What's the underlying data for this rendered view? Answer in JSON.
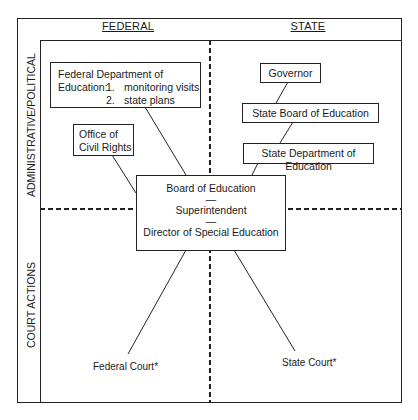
{
  "diagram": {
    "columns": [
      {
        "id": "federal",
        "label": "FEDERAL"
      },
      {
        "id": "state",
        "label": "STATE"
      }
    ],
    "rows": [
      {
        "id": "admin",
        "label": "ADMINISTRATIVE/POLITICAL"
      },
      {
        "id": "court",
        "label": "COURT ACTIONS"
      }
    ],
    "nodes": {
      "fed_dept": {
        "line1": "Federal Department of",
        "line2_prefix": "Education:",
        "items": [
          {
            "num": "1.",
            "text": "monitoring visits"
          },
          {
            "num": "2.",
            "text": "state plans"
          }
        ]
      },
      "ocr": {
        "line1": "Office of",
        "line2": "Civil Rights"
      },
      "governor": {
        "label": "Governor"
      },
      "state_board": {
        "label": "State Board of Education"
      },
      "state_dept": {
        "label": "State Department of Education"
      },
      "local": {
        "line1": "Board of Education",
        "sep1": "—",
        "line2": "Superintendent",
        "sep2": "—",
        "line3": "Director of Special Education"
      },
      "federal_court": {
        "label": "Federal Court*"
      },
      "state_court": {
        "label": "State Court*"
      }
    },
    "edges": [
      [
        "fed_dept",
        "local"
      ],
      [
        "ocr",
        "local"
      ],
      [
        "governor",
        "state_board"
      ],
      [
        "state_board",
        "state_dept"
      ],
      [
        "state_dept",
        "local"
      ],
      [
        "local",
        "federal_court"
      ],
      [
        "local",
        "state_court"
      ]
    ]
  }
}
